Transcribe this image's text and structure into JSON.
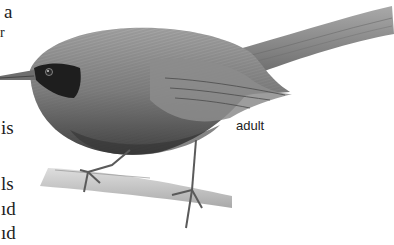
{
  "page": {
    "text_fragments": [
      {
        "text": "a",
        "x": 4,
        "y": 2
      },
      {
        "text": "r",
        "x": 0,
        "y": 28
      },
      {
        "text": "is",
        "x": 1,
        "y": 118
      },
      {
        "text": "ls",
        "x": 1,
        "y": 174
      },
      {
        "text": "ıd",
        "x": 1,
        "y": 199
      },
      {
        "text": "ıd",
        "x": 1,
        "y": 223
      }
    ],
    "illustration": {
      "subject": "bird",
      "label": "adult"
    }
  },
  "colors": {
    "plumage": "#8a8a8a",
    "plumage_dark": "#4a4a4a",
    "mask": "#1e1e1e",
    "branch": "#b8b8b8"
  }
}
